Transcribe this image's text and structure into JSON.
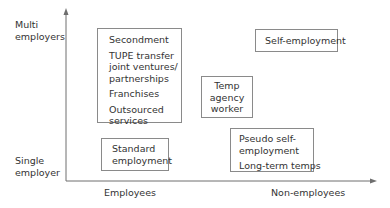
{
  "diagram": {
    "y_axis": {
      "top_label": [
        "Multi",
        "employers"
      ],
      "bottom_label": [
        "Single",
        "employer"
      ]
    },
    "x_axis": {
      "left_label": "Employees",
      "right_label": "Non-employees"
    },
    "boxes": [
      {
        "id": "multi-employer-employees",
        "items": [
          {
            "lines": [
              "Secondment"
            ]
          },
          {
            "lines": [
              "TUPE transfer",
              "joint ventures/",
              "partnerships"
            ]
          },
          {
            "lines": [
              "Franchises"
            ]
          },
          {
            "lines": [
              "Outsourced",
              "services"
            ]
          }
        ]
      },
      {
        "id": "standard-employment",
        "items": [
          {
            "lines": [
              "Standard",
              "employment"
            ]
          }
        ]
      },
      {
        "id": "self-employment",
        "items": [
          {
            "lines": [
              "Self-employment"
            ]
          }
        ]
      },
      {
        "id": "temp-agency-worker",
        "items": [
          {
            "lines": [
              "Temp",
              "agency",
              "worker"
            ]
          }
        ]
      },
      {
        "id": "pseudo-self-employment",
        "items": [
          {
            "lines": [
              "Pseudo self-",
              "employment"
            ]
          },
          {
            "lines": [
              "Long-term temps"
            ]
          }
        ]
      }
    ],
    "colors": {
      "axis": "#6e6e6e",
      "box_border": "#8a8a8a",
      "text": "#333333"
    }
  }
}
